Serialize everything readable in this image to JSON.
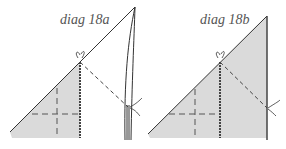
{
  "diagrams": [
    {
      "id": "a",
      "label": "diag 18a"
    },
    {
      "id": "b",
      "label": "diag 18b"
    }
  ],
  "colors": {
    "fill": "#d9d9d9",
    "line": "#333333",
    "text": "#555555"
  }
}
